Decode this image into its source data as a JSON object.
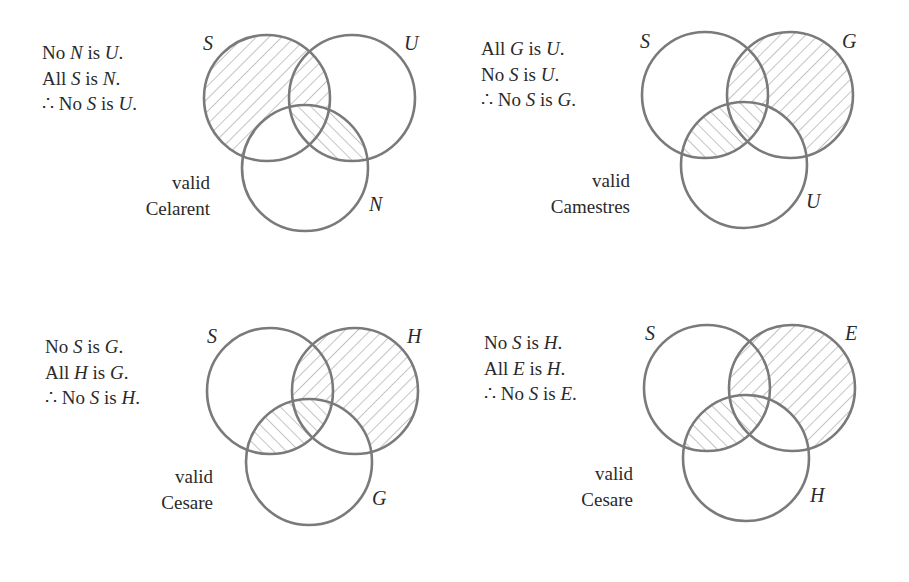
{
  "figure": {
    "colors": {
      "circle_stroke": "#7a7a7a",
      "hatch": "#8a8a8a",
      "text": "#2a2a2a",
      "background": "#ffffff"
    },
    "panels": [
      {
        "id": "celarent",
        "premises": [
          {
            "parts": [
              "No ",
              "N",
              " is ",
              "U",
              "."
            ]
          },
          {
            "parts": [
              "All ",
              "S",
              " is ",
              "N",
              "."
            ]
          },
          {
            "parts": [
              "∴ No ",
              "S",
              " is ",
              "U",
              "."
            ]
          }
        ],
        "verdict": "valid",
        "form_name": "Celarent",
        "circles": [
          {
            "label": "S",
            "cx": 267,
            "cy": 98,
            "r": 63,
            "label_x": 203,
            "label_y": 50
          },
          {
            "label": "U",
            "cx": 352,
            "cy": 98,
            "r": 63,
            "label_x": 404,
            "label_y": 50
          },
          {
            "label": "N",
            "cx": 305,
            "cy": 168,
            "r": 63,
            "label_x": 369,
            "label_y": 211
          }
        ],
        "shaded_regions": [
          "S minus N",
          "U and N"
        ]
      },
      {
        "id": "camestres",
        "premises": [
          {
            "parts": [
              "All ",
              "G",
              " is ",
              "U",
              "."
            ]
          },
          {
            "parts": [
              "No ",
              "S",
              " is ",
              "U",
              "."
            ]
          },
          {
            "parts": [
              "∴ No ",
              "S",
              " is ",
              "G",
              "."
            ]
          }
        ],
        "verdict": "valid",
        "form_name": "Camestres",
        "circles": [
          {
            "label": "S",
            "cx": 705,
            "cy": 95,
            "r": 63,
            "label_x": 640,
            "label_y": 48
          },
          {
            "label": "G",
            "cx": 790,
            "cy": 95,
            "r": 63,
            "label_x": 842,
            "label_y": 48
          },
          {
            "label": "U",
            "cx": 744,
            "cy": 165,
            "r": 63,
            "label_x": 806,
            "label_y": 208
          }
        ],
        "shaded_regions": [
          "G minus U",
          "S and U"
        ]
      },
      {
        "id": "cesare-1",
        "premises": [
          {
            "parts": [
              "No ",
              "S",
              " is ",
              "G",
              "."
            ]
          },
          {
            "parts": [
              "All ",
              "H",
              " is ",
              "G",
              "."
            ]
          },
          {
            "parts": [
              "∴ No ",
              "S",
              " is ",
              "H",
              "."
            ]
          }
        ],
        "verdict": "valid",
        "form_name": "Cesare",
        "circles": [
          {
            "label": "S",
            "cx": 270,
            "cy": 391,
            "r": 63,
            "label_x": 207,
            "label_y": 343
          },
          {
            "label": "H",
            "cx": 355,
            "cy": 391,
            "r": 63,
            "label_x": 407,
            "label_y": 343
          },
          {
            "label": "G",
            "cx": 309,
            "cy": 462,
            "r": 63,
            "label_x": 372,
            "label_y": 505
          }
        ],
        "shaded_regions": [
          "H minus G",
          "S and G"
        ]
      },
      {
        "id": "cesare-2",
        "premises": [
          {
            "parts": [
              "No ",
              "S",
              " is ",
              "H",
              "."
            ]
          },
          {
            "parts": [
              "All ",
              "E",
              " is ",
              "H",
              "."
            ]
          },
          {
            "parts": [
              "∴ No ",
              "S",
              " is ",
              "E",
              "."
            ]
          }
        ],
        "verdict": "valid",
        "form_name": "Cesare",
        "circles": [
          {
            "label": "S",
            "cx": 707,
            "cy": 388,
            "r": 63,
            "label_x": 645,
            "label_y": 340
          },
          {
            "label": "E",
            "cx": 792,
            "cy": 388,
            "r": 63,
            "label_x": 845,
            "label_y": 340
          },
          {
            "label": "H",
            "cx": 746,
            "cy": 458,
            "r": 63,
            "label_x": 810,
            "label_y": 502
          }
        ],
        "shaded_regions": [
          "E minus H",
          "S and H"
        ]
      }
    ]
  }
}
